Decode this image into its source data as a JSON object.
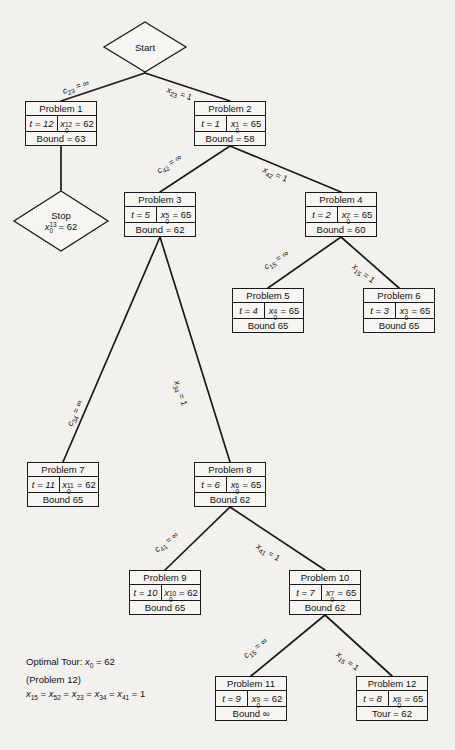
{
  "figure": {
    "type": "branch-and-bound-tree",
    "start_node": {
      "label": "Start"
    },
    "stop_node": {
      "label": "Stop",
      "value_var": "x",
      "value_sub": "0",
      "value_sup": "13",
      "value": "= 62"
    },
    "caption": {
      "line1": "Optimal Tour: x0 = 62",
      "line2": "(Problem 12)",
      "line3": "x15 = x52 = x23 = x34 = x41 = 1"
    },
    "nodes": [
      {
        "id": "p1",
        "title": "Problem 1",
        "t": "t = 12",
        "xvar": "x",
        "xsub": "0",
        "xsup": "12",
        "xval": "= 62",
        "bottom": "Bound = 63"
      },
      {
        "id": "p2",
        "title": "Problem 2",
        "t": "t = 1",
        "xvar": "x",
        "xsub": "0",
        "xsup": "1",
        "xval": "= 65",
        "bottom": "Bound = 58"
      },
      {
        "id": "p3",
        "title": "Problem 3",
        "t": "t = 5",
        "xvar": "x",
        "xsub": "0",
        "xsup": "5",
        "xval": "= 65",
        "bottom": "Bound = 62"
      },
      {
        "id": "p4",
        "title": "Problem 4",
        "t": "t = 2",
        "xvar": "x",
        "xsub": "0",
        "xsup": "2",
        "xval": "= 65",
        "bottom": "Bound = 60"
      },
      {
        "id": "p5",
        "title": "Problem 5",
        "t": "t = 4",
        "xvar": "x",
        "xsub": "0",
        "xsup": "4",
        "xval": "= 65",
        "bottom": "Bound 65"
      },
      {
        "id": "p6",
        "title": "Problem 6",
        "t": "t = 3",
        "xvar": "x",
        "xsub": "0",
        "xsup": "3",
        "xval": "= 65",
        "bottom": "Bound 65"
      },
      {
        "id": "p7",
        "title": "Problem 7",
        "t": "t = 11",
        "xvar": "x",
        "xsub": "0",
        "xsup": "11",
        "xval": "= 62",
        "bottom": "Bound 65"
      },
      {
        "id": "p8",
        "title": "Problem 8",
        "t": "t = 6",
        "xvar": "x",
        "xsub": "0",
        "xsup": "6",
        "xval": "= 65",
        "bottom": "Bound 62"
      },
      {
        "id": "p9",
        "title": "Problem 9",
        "t": "t = 10",
        "xvar": "x",
        "xsub": "0",
        "xsup": "10",
        "xval": "= 62",
        "bottom": "Bound 65"
      },
      {
        "id": "p10",
        "title": "Problem 10",
        "t": "t = 7",
        "xvar": "x",
        "xsub": "0",
        "xsup": "7",
        "xval": "= 65",
        "bottom": "Bound 62"
      },
      {
        "id": "p11",
        "title": "Problem 11",
        "t": "t = 9",
        "xvar": "x",
        "xsub": "0",
        "xsup": "9",
        "xval": "= 62",
        "bottom": "Bound ∞"
      },
      {
        "id": "p12",
        "title": "Problem 12",
        "t": "t = 8",
        "xvar": "x",
        "xsub": "0",
        "xsup": "8",
        "xval": "= 65",
        "bottom": "Tour = 62"
      }
    ],
    "edges": [
      {
        "id": "e-start-p1",
        "var": "c",
        "sub": "23",
        "rel": "= ∞"
      },
      {
        "id": "e-start-p2",
        "var": "x",
        "sub": "23",
        "rel": "= 1"
      },
      {
        "id": "e-p2-p3",
        "var": "c",
        "sub": "42",
        "rel": "= ∞"
      },
      {
        "id": "e-p2-p4",
        "var": "x",
        "sub": "42",
        "rel": "= 1"
      },
      {
        "id": "e-p4-p5",
        "var": "c",
        "sub": "15",
        "rel": "= ∞"
      },
      {
        "id": "e-p4-p6",
        "var": "x",
        "sub": "15",
        "rel": "= 1"
      },
      {
        "id": "e-p3-p7",
        "var": "c",
        "sub": "34",
        "rel": "= ∞"
      },
      {
        "id": "e-p3-p8",
        "var": "x",
        "sub": "34",
        "rel": "= 1"
      },
      {
        "id": "e-p8-p9",
        "var": "c",
        "sub": "41",
        "rel": "= ∞"
      },
      {
        "id": "e-p8-p10",
        "var": "x",
        "sub": "41",
        "rel": "= 1"
      },
      {
        "id": "e-p10-p11",
        "var": "c",
        "sub": "15",
        "rel": "= ∞"
      },
      {
        "id": "e-p10-p12",
        "var": "x",
        "sub": "15",
        "rel": "= 1"
      }
    ],
    "colors": {
      "ink": "#1a1a1a",
      "paper": "#f2f1ed",
      "box_fill": "#f7f6f2"
    }
  }
}
